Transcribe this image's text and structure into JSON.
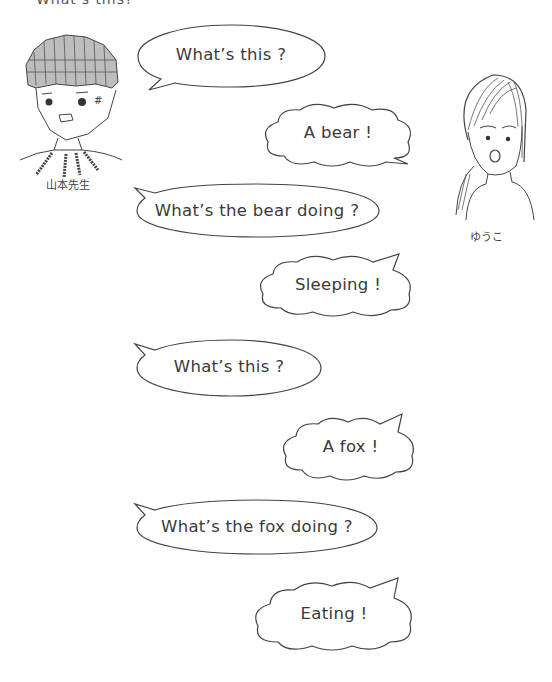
{
  "page": {
    "heading_partial": "What's this?"
  },
  "characters": {
    "teacher": {
      "name": "山本先生"
    },
    "student": {
      "name": "ゆうこ"
    }
  },
  "dialogue": [
    {
      "speaker": "teacher",
      "shape": "oval",
      "text": "What’s this ?"
    },
    {
      "speaker": "student",
      "shape": "cloud",
      "text": "A bear !"
    },
    {
      "speaker": "teacher",
      "shape": "oval",
      "text": "What’s the bear doing ?"
    },
    {
      "speaker": "student",
      "shape": "cloud",
      "text": "Sleeping !"
    },
    {
      "speaker": "teacher",
      "shape": "oval",
      "text": "What’s this ?"
    },
    {
      "speaker": "student",
      "shape": "cloud",
      "text": "A fox !"
    },
    {
      "speaker": "teacher",
      "shape": "oval",
      "text": "What’s the fox doing ?"
    },
    {
      "speaker": "student",
      "shape": "cloud",
      "text": "Eating !"
    }
  ],
  "colors": {
    "ink": "#3a3a3a",
    "background": "#ffffff"
  }
}
